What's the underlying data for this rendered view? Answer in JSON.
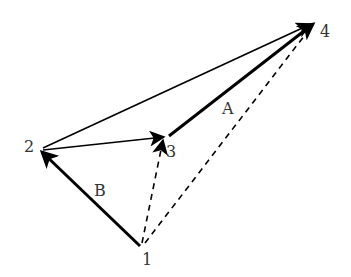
{
  "diagram": {
    "type": "vector-diagram",
    "points": [
      {
        "id": "1",
        "label": "1",
        "x": 141,
        "y": 245,
        "label_x": 142,
        "label_y": 265
      },
      {
        "id": "2",
        "label": "2",
        "x": 41,
        "y": 151,
        "label_x": 24,
        "label_y": 152
      },
      {
        "id": "3",
        "label": "3",
        "x": 166,
        "y": 136,
        "label_x": 166,
        "label_y": 157
      },
      {
        "id": "4",
        "label": "4",
        "x": 313,
        "y": 24,
        "label_x": 320,
        "label_y": 37
      }
    ],
    "edges": [
      {
        "from": "1",
        "to": "2",
        "style": "solid",
        "weight": "thick",
        "arrow": true,
        "label": "B"
      },
      {
        "from": "2",
        "to": "4",
        "style": "solid",
        "weight": "thin",
        "arrow": true,
        "label": ""
      },
      {
        "from": "2",
        "to": "3",
        "style": "solid",
        "weight": "thin",
        "arrow": true,
        "label": ""
      },
      {
        "from": "3",
        "to": "4",
        "style": "solid",
        "weight": "thick",
        "arrow": true,
        "label": "A"
      },
      {
        "from": "1",
        "to": "3",
        "style": "dashed",
        "weight": "thin",
        "arrow": true,
        "label": ""
      },
      {
        "from": "1",
        "to": "4",
        "style": "dashed",
        "weight": "thin",
        "arrow": false,
        "label": ""
      }
    ],
    "edge_labels": {
      "A": {
        "text": "A",
        "x": 222,
        "y": 114
      },
      "B": {
        "text": "B",
        "x": 94,
        "y": 196
      }
    },
    "colors": {
      "line": "#000000",
      "label": "#333333",
      "background": "#ffffff"
    }
  }
}
